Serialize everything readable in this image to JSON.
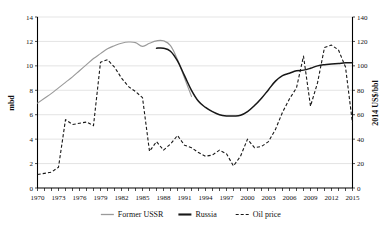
{
  "chart_data": {
    "type": "line",
    "title": "",
    "subtitle": "",
    "xlabel": "",
    "ylabel": "mbd",
    "y2label": "2014 US$/bbl",
    "xlim": [
      1970,
      2015
    ],
    "ylim": [
      0,
      14
    ],
    "y2lim": [
      0,
      140
    ],
    "y_ticks": [
      0,
      2,
      4,
      6,
      8,
      10,
      12,
      14
    ],
    "y2_ticks": [
      0,
      20,
      40,
      60,
      80,
      100,
      120,
      140
    ],
    "x_ticks": [
      1970,
      1973,
      1976,
      1979,
      1982,
      1985,
      1988,
      1991,
      1994,
      1997,
      2000,
      2003,
      2006,
      2009,
      2012,
      2015
    ],
    "x_minor_step": 1,
    "grid": "horizontal",
    "legend_position": "bottom-center",
    "series": [
      {
        "name": "Former USSR",
        "axis": "left",
        "unit": "mbd",
        "style": "solid",
        "color": "#9a9a9a",
        "x": [
          1970,
          1971,
          1972,
          1973,
          1974,
          1975,
          1976,
          1977,
          1978,
          1979,
          1980,
          1981,
          1982,
          1983,
          1984,
          1985,
          1986,
          1987,
          1988,
          1989,
          1990,
          1991,
          1992
        ],
        "values": [
          6.95,
          7.35,
          7.75,
          8.2,
          8.65,
          9.1,
          9.6,
          10.1,
          10.6,
          11.0,
          11.4,
          11.65,
          11.85,
          11.95,
          11.9,
          11.6,
          11.85,
          12.05,
          12.05,
          11.65,
          10.5,
          9.0,
          7.5
        ]
      },
      {
        "name": "Russia",
        "axis": "left",
        "unit": "mbd",
        "style": "solid",
        "color": "#171717",
        "x": [
          1987,
          1988,
          1989,
          1990,
          1991,
          1992,
          1993,
          1994,
          1995,
          1996,
          1997,
          1998,
          1999,
          2000,
          2001,
          2002,
          2003,
          2004,
          2005,
          2006,
          2007,
          2008,
          2009,
          2010,
          2011,
          2012,
          2013,
          2014,
          2015
        ],
        "values": [
          11.45,
          11.45,
          11.2,
          10.4,
          9.2,
          8.0,
          7.1,
          6.6,
          6.25,
          6.0,
          5.9,
          5.9,
          5.95,
          6.25,
          6.75,
          7.35,
          8.05,
          8.75,
          9.2,
          9.4,
          9.6,
          9.65,
          9.8,
          10.0,
          10.1,
          10.15,
          10.2,
          10.25,
          10.25
        ]
      },
      {
        "name": "Oil price",
        "axis": "right",
        "unit": "2014 US$/bbl",
        "style": "dashed",
        "color": "#171717",
        "x": [
          1970,
          1971,
          1972,
          1973,
          1974,
          1975,
          1976,
          1977,
          1978,
          1979,
          1980,
          1981,
          1982,
          1983,
          1984,
          1985,
          1986,
          1987,
          1988,
          1989,
          1990,
          1991,
          1992,
          1993,
          1994,
          1995,
          1996,
          1997,
          1998,
          1999,
          2000,
          2001,
          2002,
          2003,
          2004,
          2005,
          2006,
          2007,
          2008,
          2009,
          2010,
          2011,
          2012,
          2013,
          2014,
          2015
        ],
        "values": [
          11,
          12,
          13,
          17,
          56,
          52,
          53,
          54,
          51,
          103,
          105,
          99,
          90,
          83,
          79,
          74,
          30,
          38,
          31,
          36,
          43,
          35,
          33,
          29,
          26,
          27,
          31,
          28,
          18,
          26,
          40,
          33,
          34,
          38,
          48,
          62,
          73,
          82,
          108,
          67,
          86,
          115,
          117,
          113,
          99,
          53
        ]
      }
    ],
    "annotations": []
  },
  "axes": {
    "left": {
      "title": "mbd",
      "ticks": [
        "0",
        "2",
        "4",
        "6",
        "8",
        "10",
        "12",
        "14"
      ]
    },
    "right": {
      "title": "2014 US$/bbl",
      "ticks": [
        "0",
        "20",
        "40",
        "60",
        "80",
        "100",
        "120",
        "140"
      ]
    },
    "bottom": {
      "ticks": [
        "1970",
        "1973",
        "1976",
        "1979",
        "1982",
        "1985",
        "1988",
        "1991",
        "1994",
        "1997",
        "2000",
        "2003",
        "2006",
        "2009",
        "2012",
        "2015"
      ]
    }
  },
  "legend": {
    "items": [
      {
        "label": "Former USSR",
        "color": "#9a9a9a",
        "style": "solid"
      },
      {
        "label": "Russia",
        "color": "#171717",
        "style": "solid-bold"
      },
      {
        "label": "Oil price",
        "color": "#171717",
        "style": "dashed"
      }
    ]
  },
  "colors": {
    "ussr": "#9a9a9a",
    "russia": "#171717",
    "oil": "#171717",
    "grid": "#c9c9c9",
    "axis": "#000000",
    "background": "#ffffff"
  }
}
